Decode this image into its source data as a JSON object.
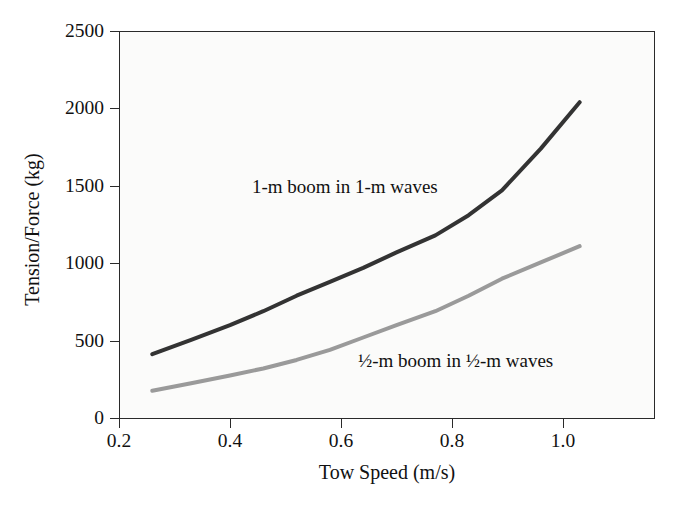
{
  "chart_data": {
    "type": "line",
    "title": "",
    "xlabel": "Tow Speed (m/s)",
    "ylabel": "Tension/Force (kg)",
    "xlim": [
      0.13,
      1.09
    ],
    "ylim": [
      0,
      2500
    ],
    "grid": false,
    "legend_position": "inline-annotations",
    "xticks": [
      0.2,
      0.4,
      0.6,
      0.8,
      1.0
    ],
    "xtick_labels": [
      "0.2",
      "0.4",
      "0.6",
      "0.8",
      "1.0"
    ],
    "yticks": [
      0,
      500,
      1000,
      1500,
      2000,
      2500
    ],
    "ytick_labels": [
      "0",
      "500",
      "1000",
      "1500",
      "2000",
      "2500"
    ],
    "series": [
      {
        "name": "1-m boom in 1-m waves",
        "label": "1-m boom in 1-m waves",
        "color": "#333333",
        "line_width": 4,
        "x": [
          0.26,
          0.33,
          0.4,
          0.46,
          0.52,
          0.58,
          0.64,
          0.7,
          0.77,
          0.83,
          0.89,
          0.96,
          1.03
        ],
        "y": [
          412,
          505,
          600,
          690,
          790,
          880,
          970,
          1070,
          1180,
          1310,
          1470,
          1740,
          2040
        ]
      },
      {
        "name": "half-m boom in half-m waves",
        "label": "½-m boom in ½-m waves",
        "color": "#9a9a9a",
        "line_width": 4,
        "x": [
          0.26,
          0.33,
          0.4,
          0.46,
          0.52,
          0.58,
          0.64,
          0.7,
          0.77,
          0.83,
          0.89,
          0.96,
          1.03
        ],
        "y": [
          176,
          225,
          275,
          320,
          375,
          440,
          520,
          600,
          690,
          790,
          900,
          1005,
          1110
        ]
      }
    ],
    "annotations": [
      {
        "text": "1-m boom in 1-m waves",
        "x": 0.415,
        "y": 1700
      },
      {
        "text": "½-m boom in ½-m waves",
        "x": 0.62,
        "y": 470
      }
    ]
  },
  "axes": {
    "x_title": "Tow Speed (m/s)",
    "y_title": "Tension/Force (kg)",
    "x_tick_labels": [
      "0.2",
      "0.4",
      "0.6",
      "0.8",
      "1.0"
    ],
    "y_tick_labels": [
      "2500",
      "2000",
      "1500",
      "1000",
      "500",
      "0"
    ]
  },
  "colors": {
    "series_dark": "#333333",
    "series_light": "#9a9a9a",
    "frame": "#2a2a2a",
    "plot_background": "#fbfbfa",
    "page_background": "#ffffff",
    "text": "#111111"
  }
}
